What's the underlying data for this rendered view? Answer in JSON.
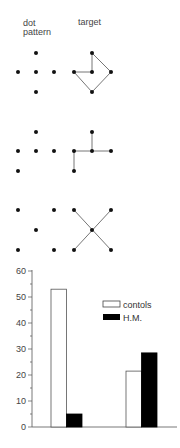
{
  "headers": {
    "dot_pattern_line1": "dot",
    "dot_pattern_line2": "pattern",
    "target": "target"
  },
  "patterns": [
    {
      "dots": [
        [
          36,
          53
        ],
        [
          18,
          72
        ],
        [
          36,
          72
        ],
        [
          54,
          72
        ],
        [
          36,
          92
        ]
      ],
      "target_dots": [
        [
          92,
          53
        ],
        [
          74,
          72
        ],
        [
          92,
          72
        ],
        [
          111,
          72
        ],
        [
          92,
          92
        ]
      ],
      "target_lines": [
        [
          74,
          72,
          92,
          72
        ],
        [
          92,
          72,
          92,
          53
        ],
        [
          92,
          53,
          111,
          72
        ],
        [
          111,
          72,
          92,
          92
        ],
        [
          92,
          92,
          74,
          72
        ]
      ]
    },
    {
      "dots": [
        [
          36,
          132
        ],
        [
          18,
          151
        ],
        [
          36,
          151
        ],
        [
          54,
          151
        ],
        [
          18,
          171
        ]
      ],
      "target_dots": [
        [
          92,
          132
        ],
        [
          74,
          151
        ],
        [
          92,
          151
        ],
        [
          111,
          151
        ],
        [
          74,
          171
        ]
      ],
      "target_lines": [
        [
          74,
          171,
          74,
          151
        ],
        [
          74,
          151,
          111,
          151
        ],
        [
          92,
          151,
          92,
          132
        ]
      ]
    },
    {
      "dots": [
        [
          18,
          210
        ],
        [
          54,
          210
        ],
        [
          36,
          230
        ],
        [
          18,
          250
        ],
        [
          54,
          250
        ]
      ],
      "target_dots": [
        [
          74,
          210
        ],
        [
          111,
          210
        ],
        [
          92,
          230
        ],
        [
          74,
          250
        ],
        [
          111,
          250
        ]
      ],
      "target_lines": [
        [
          74,
          210,
          111,
          250
        ],
        [
          111,
          210,
          74,
          250
        ]
      ]
    }
  ],
  "chart_data": {
    "type": "bar",
    "categories": [
      "group 1",
      "group 2"
    ],
    "series": [
      {
        "name": "contols",
        "values": [
          53,
          21.5
        ],
        "color": "#ffffff"
      },
      {
        "name": "H.M.",
        "values": [
          5,
          28.5
        ],
        "color": "#000000"
      }
    ],
    "title": "",
    "xlabel": "",
    "ylabel": "",
    "ylim": [
      0,
      60
    ],
    "yticks": [
      0,
      10,
      20,
      30,
      40,
      50,
      60
    ],
    "grid": false,
    "legend_position": "upper right"
  },
  "legend": {
    "controls": "contols",
    "hm": "H.M."
  },
  "yticks": {
    "t0": "0",
    "t10": "10",
    "t20": "20",
    "t30": "30",
    "t40": "40",
    "t50": "50",
    "t60": "60"
  }
}
